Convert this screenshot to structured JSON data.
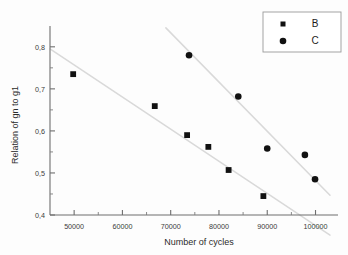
{
  "chart_data": {
    "type": "scatter",
    "title": "",
    "xlabel": "Number of cycles",
    "ylabel": "Relation of gn to g1",
    "xlim": [
      45000,
      103000
    ],
    "ylim": [
      0.4,
      0.84
    ],
    "grid": false,
    "legend_position": "top-right",
    "x_ticks": [
      {
        "value": 50000,
        "label": "50000"
      },
      {
        "value": 60000,
        "label": "60000"
      },
      {
        "value": 70000,
        "label": "70000"
      },
      {
        "value": 80000,
        "label": "80000"
      },
      {
        "value": 90000,
        "label": "90000"
      },
      {
        "value": 100000,
        "label": "100000"
      }
    ],
    "x_minor_ticks": [
      55000,
      65000,
      75000,
      85000,
      95000
    ],
    "y_ticks": [
      {
        "value": 0.4,
        "label": "0,4"
      },
      {
        "value": 0.5,
        "label": "0,5"
      },
      {
        "value": 0.6,
        "label": "0,6"
      },
      {
        "value": 0.7,
        "label": "0,7"
      },
      {
        "value": 0.8,
        "label": "0,8"
      }
    ],
    "y_minor_ticks": [
      0.45,
      0.55,
      0.65,
      0.75
    ],
    "series": [
      {
        "name": "B",
        "marker": "square",
        "color": "#111111",
        "points": [
          {
            "x": 49800,
            "y": 0.735
          },
          {
            "x": 66700,
            "y": 0.659
          },
          {
            "x": 73400,
            "y": 0.59
          },
          {
            "x": 77800,
            "y": 0.562
          },
          {
            "x": 82000,
            "y": 0.507
          },
          {
            "x": 89200,
            "y": 0.445
          }
        ],
        "trend_line": {
          "x1": 45000,
          "y1": 0.795,
          "x2": 103000,
          "y2": 0.352
        }
      },
      {
        "name": "C",
        "marker": "circle",
        "color": "#111111",
        "points": [
          {
            "x": 73800,
            "y": 0.78
          },
          {
            "x": 84000,
            "y": 0.682
          },
          {
            "x": 90000,
            "y": 0.558
          },
          {
            "x": 97800,
            "y": 0.543
          },
          {
            "x": 99900,
            "y": 0.485
          }
        ],
        "trend_line": {
          "x1": 69000,
          "y1": 0.845,
          "x2": 103000,
          "y2": 0.447
        }
      }
    ]
  },
  "legend": {
    "entries": [
      {
        "label": "B",
        "marker": "square"
      },
      {
        "label": "C",
        "marker": "circle"
      }
    ]
  }
}
